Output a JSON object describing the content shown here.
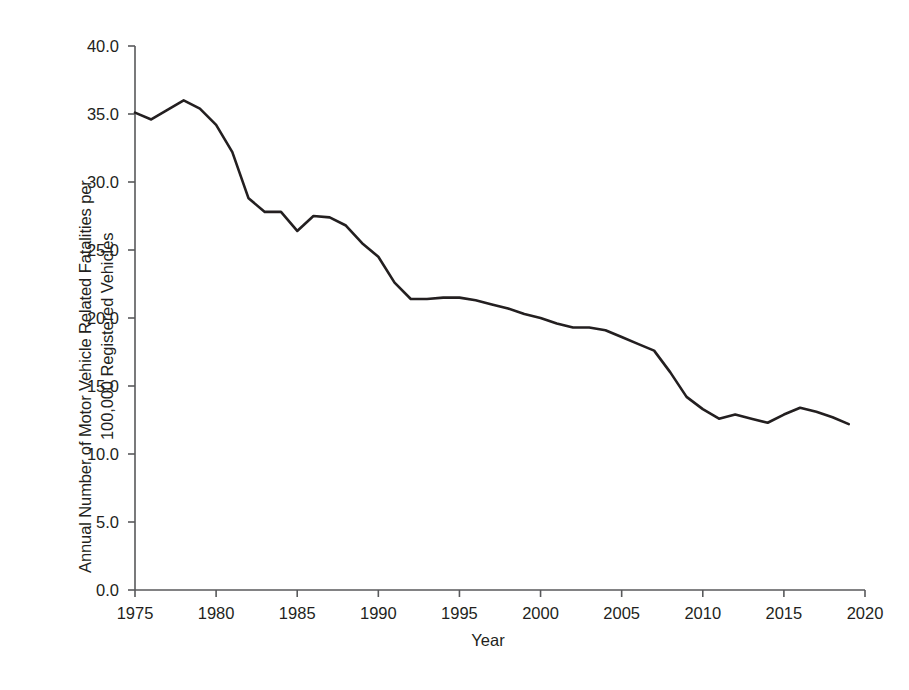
{
  "chart_data": {
    "type": "line",
    "title": "",
    "xlabel": "Year",
    "ylabel_line1": "Annual Number of Motor Vehicle Related Fatalities per",
    "ylabel_line2": "100,000 Registered Vehicles",
    "ylabel": "Annual Number of Motor Vehicle Related Fatalities per 100,000 Registered Vehicles",
    "grid": false,
    "legend": "none",
    "xlim": [
      1975,
      2020
    ],
    "ylim": [
      0.0,
      40.0
    ],
    "x_tick_labels": [
      "1975",
      "1980",
      "1985",
      "1990",
      "1995",
      "2000",
      "2005",
      "2010",
      "2015",
      "2020"
    ],
    "x_ticks": [
      1975,
      1980,
      1985,
      1990,
      1995,
      2000,
      2005,
      2010,
      2015,
      2020
    ],
    "y_tick_labels": [
      "40.0",
      "35.0",
      "30.0",
      "25.0",
      "20.0",
      "15.0",
      "10.0",
      "5.0",
      "0.0"
    ],
    "y_ticks": [
      40.0,
      35.0,
      30.0,
      25.0,
      20.0,
      15.0,
      10.0,
      5.0,
      0.0
    ],
    "line_color": "#231f20",
    "x": [
      1975,
      1976,
      1977,
      1978,
      1979,
      1980,
      1981,
      1982,
      1983,
      1984,
      1985,
      1986,
      1987,
      1988,
      1989,
      1990,
      1991,
      1992,
      1993,
      1994,
      1995,
      1996,
      1997,
      1998,
      1999,
      2000,
      2001,
      2002,
      2003,
      2004,
      2005,
      2006,
      2007,
      2008,
      2009,
      2010,
      2011,
      2012,
      2013,
      2014,
      2015,
      2016,
      2017,
      2018,
      2019
    ],
    "values": [
      35.1,
      34.6,
      35.3,
      36.0,
      35.4,
      34.2,
      32.2,
      28.8,
      27.8,
      27.8,
      26.4,
      27.5,
      27.4,
      26.8,
      25.5,
      24.5,
      22.6,
      21.4,
      21.4,
      21.5,
      21.5,
      21.3,
      21.0,
      20.7,
      20.3,
      20.0,
      19.6,
      19.3,
      19.3,
      19.1,
      18.6,
      18.1,
      17.6,
      16.0,
      14.2,
      13.3,
      12.6,
      12.9,
      12.6,
      12.3,
      12.9,
      13.4,
      13.1,
      12.7,
      12.2
    ]
  }
}
